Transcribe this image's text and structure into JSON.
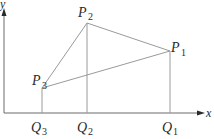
{
  "diagram": {
    "type": "coordinate-geometry",
    "axes": {
      "x_label": "x",
      "y_label": "y",
      "origin": [
        4,
        113
      ],
      "x_end": 204,
      "y_end": 8
    },
    "points": [
      {
        "id": "P1",
        "letter": "P",
        "sub": "1",
        "pos": [
          170,
          51
        ]
      },
      {
        "id": "P2",
        "letter": "P",
        "sub": "2",
        "pos": [
          87,
          23
        ]
      },
      {
        "id": "P3",
        "letter": "P",
        "sub": "3",
        "pos": [
          42,
          88
        ]
      }
    ],
    "feet": [
      {
        "id": "Q1",
        "letter": "Q",
        "sub": "1",
        "x": 170
      },
      {
        "id": "Q2",
        "letter": "Q",
        "sub": "2",
        "x": 87
      },
      {
        "id": "Q3",
        "letter": "Q",
        "sub": "3",
        "x": 42
      }
    ],
    "segments": [
      [
        "P3",
        "P2"
      ],
      [
        "P2",
        "P1"
      ],
      [
        "P3",
        "P1"
      ],
      [
        "P1",
        "Q1"
      ],
      [
        "P2",
        "Q2"
      ],
      [
        "P3",
        "Q3"
      ]
    ],
    "colors": {
      "line": "#9a9a9a",
      "axis": "#6a6a6a",
      "text": "#2a2a2a"
    }
  }
}
